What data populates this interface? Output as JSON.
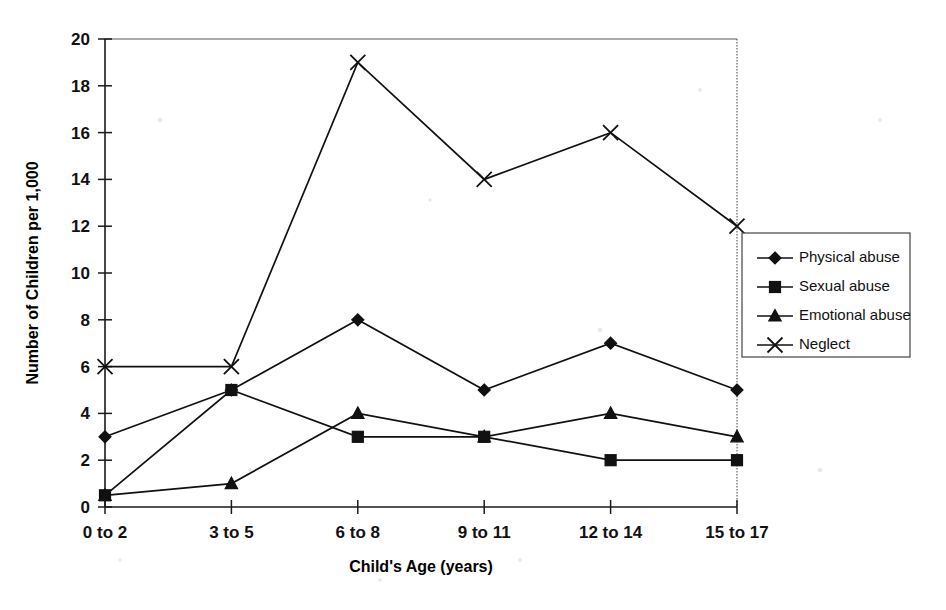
{
  "chart_data": {
    "type": "line",
    "title": "",
    "subtitle": "",
    "xlabel": "Child's Age (years)",
    "ylabel": "Number of Children per 1,000",
    "categories": [
      "0 to 2",
      "3 to 5",
      "6 to 8",
      "9 to 11",
      "12 to 14",
      "15 to 17"
    ],
    "ylim": [
      0,
      20
    ],
    "ytick_labels": [
      "0",
      "2",
      "4",
      "6",
      "8",
      "10",
      "12",
      "14",
      "16",
      "18",
      "20"
    ],
    "ytick_values": [
      0,
      2,
      4,
      6,
      8,
      10,
      12,
      14,
      16,
      18,
      20
    ],
    "grid": false,
    "legend_position": "right",
    "series": [
      {
        "name": "Physical abuse",
        "marker": "diamond",
        "values": [
          3,
          5,
          8,
          5,
          7,
          5
        ]
      },
      {
        "name": "Sexual abuse",
        "marker": "square",
        "values": [
          0.5,
          5,
          3,
          3,
          2,
          2
        ]
      },
      {
        "name": "Emotional abuse",
        "marker": "triangle",
        "values": [
          0.5,
          1,
          4,
          3,
          4,
          3
        ]
      },
      {
        "name": "Neglect",
        "marker": "x",
        "values": [
          6,
          6,
          19,
          14,
          16,
          12
        ]
      }
    ]
  },
  "colors": {
    "ink": "#111111",
    "axis": "#1a1a1a",
    "frame": "#555555",
    "background": "#ffffff"
  },
  "legend": {
    "entries": [
      "Physical abuse",
      "Sexual abuse",
      "Emotional abuse",
      "Neglect"
    ]
  }
}
